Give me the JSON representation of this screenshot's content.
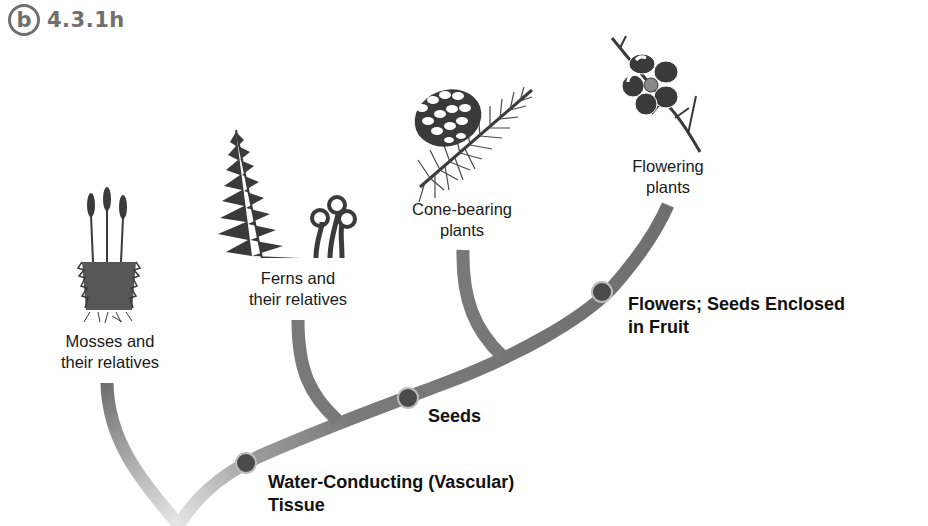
{
  "figure": {
    "badge_letter": "b",
    "figure_id": "4.3.1h"
  },
  "groups": [
    {
      "label_line1": "Mosses and",
      "label_line2": "their relatives",
      "icon": "moss-icon"
    },
    {
      "label_line1": "Ferns and",
      "label_line2": "their relatives",
      "icon": "fern-icon"
    },
    {
      "label_line1": "Cone-bearing",
      "label_line2": "plants",
      "icon": "pine-cone-icon"
    },
    {
      "label_line1": "Flowering",
      "label_line2": "plants",
      "icon": "flower-icon"
    }
  ],
  "traits": [
    {
      "line1": "Water-Conducting (Vascular)",
      "line2": "Tissue"
    },
    {
      "line1": "Seeds",
      "line2": ""
    },
    {
      "line1": "Flowers; Seeds Enclosed",
      "line2": "in Fruit"
    }
  ],
  "colors": {
    "branch": "#787878",
    "node": "#4a4a4a",
    "node_ring": "#bdbdbd",
    "badge": "#707070",
    "icon": "#3a3a3a"
  }
}
